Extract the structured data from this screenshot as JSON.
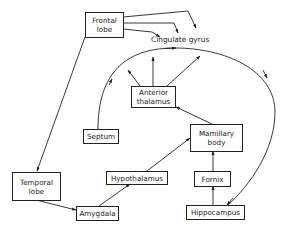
{
  "diagram": {
    "type": "limbic-system-circuit",
    "nodes": {
      "frontal_lobe": {
        "line1": "Frontal",
        "line2": "lobe"
      },
      "cingulate_gyrus": {
        "label": "Cingulate gyrus"
      },
      "anterior_thalamus": {
        "line1": "Anterior",
        "line2": "thalamus"
      },
      "septum": {
        "label": "Septum"
      },
      "mamillary_body": {
        "line1": "Mamillary",
        "line2": "body"
      },
      "temporal_lobe": {
        "line1": "Temporal",
        "line2": "lobe"
      },
      "hypothalamus": {
        "label": "Hypothalamus"
      },
      "fornix": {
        "label": "Fornix"
      },
      "amygdala": {
        "label": "Amygdala"
      },
      "hippocampus": {
        "label": "Hippocampus"
      }
    },
    "edges": [
      {
        "from": "Frontal lobe",
        "to": "Cingulate gyrus",
        "count": 3
      },
      {
        "from": "Frontal lobe",
        "to": "Temporal lobe"
      },
      {
        "from": "Temporal lobe",
        "to": "Amygdala"
      },
      {
        "from": "Amygdala",
        "to": "Hypothalamus"
      },
      {
        "from": "Hypothalamus",
        "to": "Mamillary body"
      },
      {
        "from": "Hippocampus",
        "to": "Fornix"
      },
      {
        "from": "Fornix",
        "to": "Mamillary body"
      },
      {
        "from": "Mamillary body",
        "to": "Anterior thalamus"
      },
      {
        "from": "Anterior thalamus",
        "to": "Cingulate gyrus",
        "count": 3
      },
      {
        "from": "Septum",
        "to": "Cingulate gyrus",
        "via": "arc"
      },
      {
        "from": "Cingulate gyrus",
        "to": "Hippocampus",
        "via": "arc"
      }
    ],
    "colors": {
      "line": "#222222",
      "background": "#ffffff"
    }
  }
}
